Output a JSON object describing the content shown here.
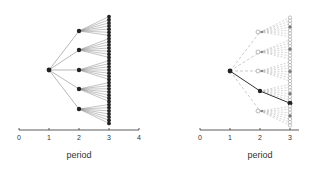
{
  "panels": [
    {
      "id": "full-tree",
      "xlabel": "period",
      "x_ticks": [
        "0",
        "1",
        "2",
        "3",
        "4"
      ],
      "axis": {
        "x0": 19,
        "unit": 30,
        "y": 130,
        "min": 0,
        "max": 4
      },
      "root": {
        "period": 1,
        "y": 70
      },
      "children_y": [
        31,
        50,
        70,
        89,
        109
      ],
      "leaves_per_child": 7,
      "leaf_spacing": 3.2,
      "edge_style": "solid",
      "node_style": "filled"
    },
    {
      "id": "sampled-path-tree",
      "xlabel": "period",
      "x_ticks": [
        "0",
        "1",
        "2",
        "3"
      ],
      "axis": {
        "x0": 200,
        "unit": 30,
        "y": 130,
        "min": 0,
        "max": 3.3
      },
      "root": {
        "period": 1,
        "y": 71
      },
      "children_y": [
        32,
        52,
        71,
        91,
        111
      ],
      "leaves_per_child": 7,
      "leaf_spacing": 3.2,
      "edge_style": "dashed",
      "node_style": "hollow",
      "highlight_path": {
        "child_index": 3,
        "leaf_index": 6
      },
      "marked_leaf_index": 3
    }
  ],
  "colors": {
    "line": "#888888",
    "node": "#222222",
    "axis": "#333333",
    "dashed": "#aaaaaa",
    "hollow": "#999999"
  }
}
